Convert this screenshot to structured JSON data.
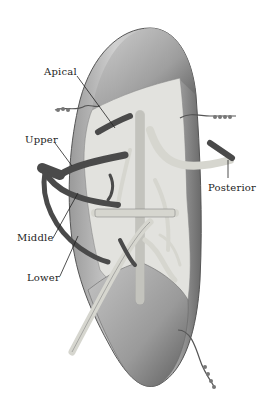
{
  "figure": {
    "labels": {
      "apical": "Apical",
      "upper": "Upper",
      "posterior": "Posterior",
      "middle": "Middle",
      "lower": "Lower"
    },
    "colors": {
      "background": "#ffffff",
      "lung_surface": "#bdbdbd",
      "lung_shadow": "#6f6f6f",
      "cut_surface": "#e4e4e0",
      "dark_vessel": "#4a4a4a",
      "light_vessel": "#d8d8d2",
      "label_text": "#222222"
    }
  }
}
